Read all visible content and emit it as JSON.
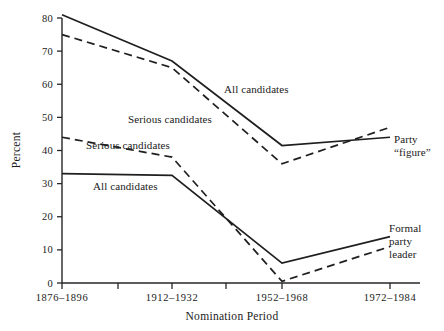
{
  "chart_data": {
    "type": "line",
    "title": "",
    "xlabel": "Nomination Period",
    "ylabel": "Percent",
    "categories": [
      "1876–1896",
      "1912–1932",
      "1952–1968",
      "1972–1984"
    ],
    "ylim": [
      0,
      80
    ],
    "yticks": [
      0,
      10,
      20,
      30,
      40,
      50,
      60,
      70,
      80
    ],
    "ytick_labels": [
      "0",
      "10",
      "20",
      "30",
      "40",
      "50",
      "60",
      "70",
      "80"
    ],
    "grid": false,
    "legend": "inline annotations",
    "series": [
      {
        "name": "All candidates (Party \"figure\")",
        "style": "solid",
        "values": [
          81,
          67,
          41.5,
          44
        ],
        "end_label": "Party \"figure\"",
        "inline_label": "All candidates"
      },
      {
        "name": "Serious candidates (Party \"figure\")",
        "style": "dashed",
        "values": [
          75,
          65,
          36,
          47
        ],
        "inline_label": "Serious candidates"
      },
      {
        "name": "Serious candidates (Formal party leader)",
        "style": "dashed",
        "values": [
          44,
          38,
          0.5,
          11
        ],
        "inline_label": "Serious candidates"
      },
      {
        "name": "All candidates (Formal party leader)",
        "style": "solid",
        "values": [
          33,
          32.5,
          6,
          14
        ],
        "end_label": "Formal party leader",
        "inline_label": "All candidates"
      }
    ],
    "annotations": [
      {
        "id": "all-candidates-upper",
        "text": "All candidates",
        "x": 224,
        "y": 93
      },
      {
        "id": "serious-candidates-upper",
        "text": "Serious candidates",
        "x": 128,
        "y": 123
      },
      {
        "id": "serious-candidates-lower",
        "text": "Serious candidates",
        "x": 86,
        "y": 149
      },
      {
        "id": "all-candidates-lower",
        "text": "All candidates",
        "x": 93,
        "y": 190
      },
      {
        "id": "party-figure-line1",
        "text": "Party",
        "x": 394,
        "y": 143
      },
      {
        "id": "party-figure-line2",
        "text": "“figure”",
        "x": 394,
        "y": 156
      },
      {
        "id": "formal-party-leader-line1",
        "text": "Formal",
        "x": 389,
        "y": 232
      },
      {
        "id": "formal-party-leader-line2",
        "text": "party",
        "x": 389,
        "y": 245
      },
      {
        "id": "formal-party-leader-line3",
        "text": "leader",
        "x": 389,
        "y": 258
      }
    ],
    "colors": {
      "ink": "#1f1f1f",
      "background": "#ffffff"
    }
  }
}
